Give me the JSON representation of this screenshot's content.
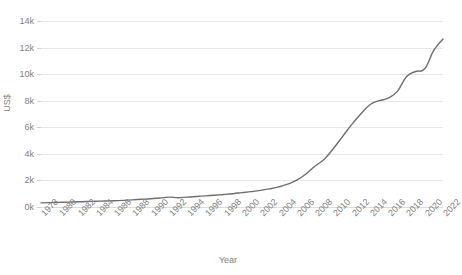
{
  "chart_data": {
    "type": "line",
    "title": "",
    "xlabel": "Year",
    "ylabel": "US$",
    "grid": true,
    "legend": "none",
    "line_color": "#6e6e6e",
    "gridline_color": "#e6e6e6",
    "background_color": "#ffffff",
    "xlim": [
      1978,
      2022
    ],
    "ylim": [
      0,
      14000
    ],
    "y_tick_values": [
      0,
      2000,
      4000,
      6000,
      8000,
      10000,
      12000,
      14000
    ],
    "y_tick_labels": [
      "0k",
      "2k",
      "4k",
      "6k",
      "8k",
      "10k",
      "12k",
      "14k"
    ],
    "x_tick_labels": [
      "1978",
      "1980",
      "1982",
      "1984",
      "1986",
      "1988",
      "1990",
      "1992",
      "1994",
      "1996",
      "1998",
      "2000",
      "2002",
      "2004",
      "2006",
      "2008",
      "2010",
      "2012",
      "2014",
      "2016",
      "2018",
      "2020",
      "2022"
    ],
    "x_tick_values": [
      1978,
      1980,
      1982,
      1984,
      1986,
      1988,
      1990,
      1992,
      1994,
      1996,
      1998,
      2000,
      2002,
      2004,
      2006,
      2008,
      2010,
      2012,
      2014,
      2016,
      2018,
      2020,
      2022
    ],
    "x": [
      1978,
      1979,
      1980,
      1981,
      1982,
      1983,
      1984,
      1985,
      1986,
      1987,
      1988,
      1989,
      1990,
      1991,
      1992,
      1993,
      1994,
      1995,
      1996,
      1997,
      1998,
      1999,
      2000,
      2001,
      2002,
      2003,
      2004,
      2005,
      2006,
      2007,
      2008,
      2009,
      2010,
      2011,
      2012,
      2013,
      2014,
      2015,
      2016,
      2017,
      2018,
      2019,
      2020,
      2021,
      2022
    ],
    "values": [
      310,
      330,
      350,
      370,
      390,
      410,
      430,
      450,
      470,
      500,
      540,
      580,
      620,
      680,
      740,
      700,
      740,
      790,
      840,
      890,
      940,
      1000,
      1080,
      1160,
      1250,
      1360,
      1510,
      1720,
      2020,
      2480,
      3080,
      3600,
      4400,
      5300,
      6200,
      7000,
      7700,
      8000,
      8200,
      8700,
      9800,
      10200,
      10400,
      11800,
      12650
    ]
  }
}
